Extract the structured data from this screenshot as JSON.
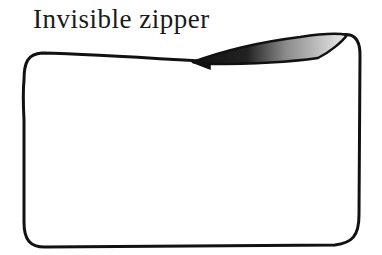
{
  "diagram": {
    "title": "Invisible zipper",
    "elements": [
      {
        "type": "outline",
        "shape": "rounded-rectangle",
        "description": "pouch outline"
      },
      {
        "type": "zipper-flap",
        "shape": "shaded-wedge",
        "position": "top-right edge"
      }
    ],
    "colors": {
      "stroke": "#111111",
      "background": "#ffffff",
      "flap_dark": "#111111",
      "flap_light": "#e6e6e6"
    }
  }
}
